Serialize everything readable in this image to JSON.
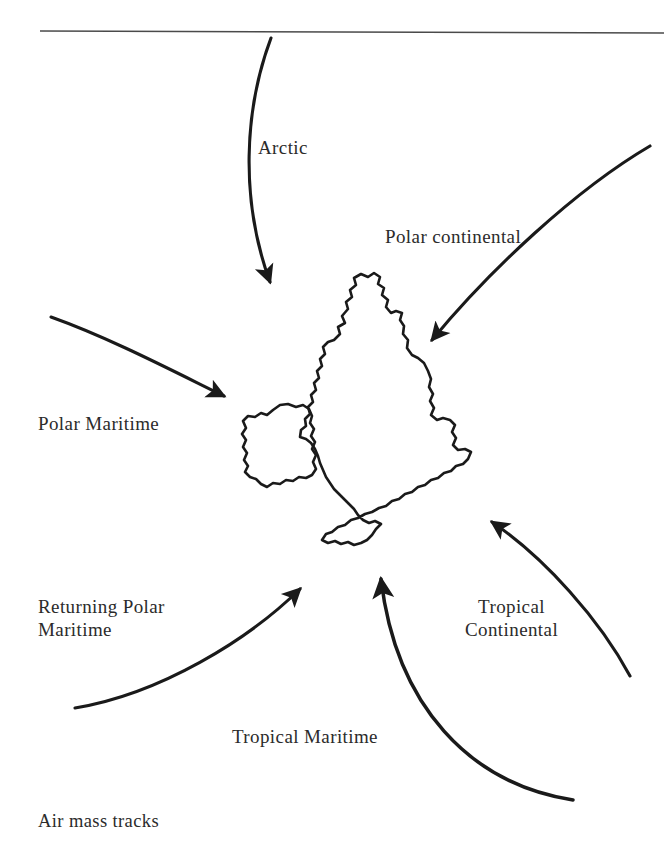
{
  "figure": {
    "caption": "Air mass tracks",
    "background_color": "#ffffff",
    "ink_color": "#1a1a1a",
    "text_color": "#2b2b2b",
    "top_rule": {
      "name": "horizontal-rule",
      "x_start": 40,
      "x_end": 664,
      "y": 31
    },
    "map": {
      "name": "british-isles-outline",
      "regions": [
        "Great Britain",
        "Ireland"
      ],
      "stroke_color": "#1a1a1a"
    },
    "air_masses": [
      {
        "id": "arctic",
        "label": "Arctic",
        "origin_direction": "north",
        "arrow": "curved-arrow-down"
      },
      {
        "id": "polar-continental",
        "label": "Polar continental",
        "origin_direction": "north-east",
        "arrow": "curved-arrow-south-west"
      },
      {
        "id": "polar-maritime",
        "label": "Polar Maritime",
        "origin_direction": "north-west",
        "arrow": "curved-arrow-south-east"
      },
      {
        "id": "returning-polar-maritime",
        "label_line1": "Returning Polar",
        "label_line2": "Maritime",
        "origin_direction": "south-west",
        "arrow": "curved-arrow-north-east"
      },
      {
        "id": "tropical-maritime",
        "label": "Tropical Maritime",
        "origin_direction": "south",
        "arrow": "curved-arrow-north"
      },
      {
        "id": "tropical-continental",
        "label_line1": "Tropical",
        "label_line2": "Continental",
        "origin_direction": "south-east",
        "arrow": "curved-arrow-north-west"
      }
    ]
  }
}
